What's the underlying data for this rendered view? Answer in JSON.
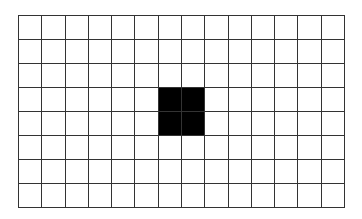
{
  "grid": {
    "columns": 14,
    "rows": 8,
    "line_color": "#333333",
    "background_color": "#ffffff",
    "fill_color": "#000000",
    "filled_cells": [
      {
        "row": 3,
        "col": 6
      },
      {
        "row": 3,
        "col": 7
      },
      {
        "row": 4,
        "col": 6
      },
      {
        "row": 4,
        "col": 7
      }
    ]
  }
}
